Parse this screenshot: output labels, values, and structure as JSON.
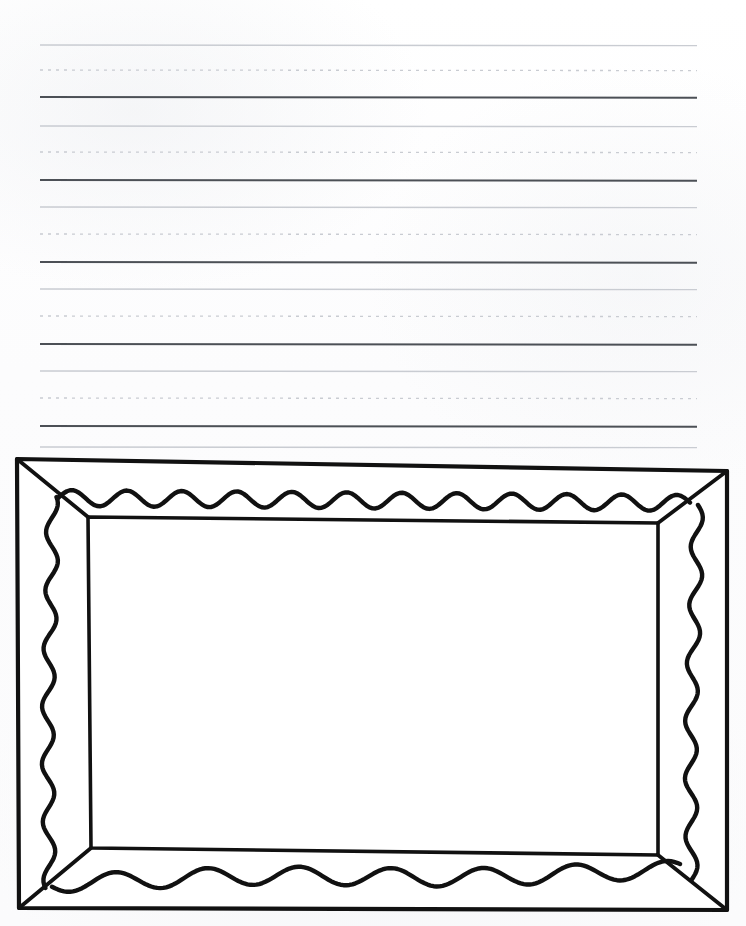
{
  "document": {
    "type": "handwriting-practice-worksheet",
    "title": "Handwriting Practice Page with Picture Frame Drawing",
    "page_width": 746,
    "page_height": 926,
    "background_color": "#fdfdfd",
    "orientation": "portrait"
  },
  "writing_area": {
    "label": "Lined handwriting practice area",
    "line_left_x": 40,
    "line_right_x": 697,
    "rule_group_count": 6,
    "line_style_legend": [
      {
        "name": "top-line",
        "role": "cap height guide",
        "style": "solid",
        "color": "#c9ccd2",
        "thickness": 1.4
      },
      {
        "name": "mid-line",
        "role": "x-height guide",
        "style": "dotted",
        "color": "#c9ccd2",
        "thickness": 1.3
      },
      {
        "name": "base-line",
        "role": "baseline",
        "style": "solid",
        "color": "#4c5056",
        "thickness": 2.1
      }
    ],
    "rule_groups": [
      {
        "index": 1,
        "top_y": 45,
        "mid_y": 70,
        "base_y": 97
      },
      {
        "index": 2,
        "top_y": 126,
        "mid_y": 152,
        "base_y": 180
      },
      {
        "index": 3,
        "top_y": 207,
        "mid_y": 234,
        "base_y": 262
      },
      {
        "index": 4,
        "top_y": 289,
        "mid_y": 316,
        "base_y": 344
      },
      {
        "index": 5,
        "top_y": 371,
        "mid_y": 398,
        "base_y": 426
      },
      {
        "index": 6,
        "top_y": 447,
        "mid_y": 0,
        "base_y": 0
      }
    ]
  },
  "drawing": {
    "label": "Picture frame line drawing",
    "subject": "empty picture frame",
    "stroke_color": "#111111",
    "fill_color": "#ffffff",
    "outer_rect": {
      "left": 16,
      "top": 459,
      "right": 728,
      "bottom": 911
    },
    "inner_rect": {
      "left": 88,
      "top": 517,
      "right": 660,
      "bottom": 855
    },
    "frame_border_width_px": 72,
    "has_miter_diagonals": true,
    "decoration": {
      "name": "wavy-scallop-trim",
      "sides": [
        "top",
        "right",
        "bottom",
        "left"
      ],
      "top_period_px": 55,
      "top_amplitude_px": 8,
      "side_period_px": 58,
      "side_amplitude_px": 6,
      "bottom_period_px": 92,
      "bottom_amplitude_px": 9,
      "stroke_width": 4.4
    }
  }
}
